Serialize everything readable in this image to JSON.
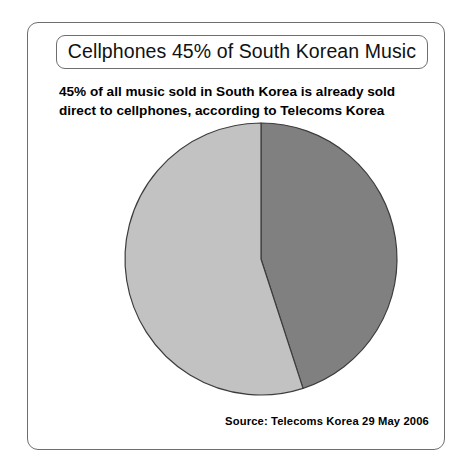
{
  "card": {
    "title": "Cellphones 45% of South Korean Music",
    "subtitle_line_1": "45% of all music sold in South Korea is already sold",
    "subtitle_line_2": "direct to cellphones, according to Telecoms Korea",
    "source": "Source: Telecoms Korea 29 May 2006"
  },
  "chart_data": {
    "type": "pie",
    "title": "Cellphones 45% of South Korean Music",
    "subtitle": "45% of all music sold in South Korea is already sold direct to cellphones, according to Telecoms Korea",
    "source": "Source: Telecoms Korea 29 May 2006",
    "categories": [
      "Sold direct to cellphones",
      "Sold through other channels"
    ],
    "values": [
      45,
      55
    ],
    "unit": "%",
    "colors": [
      "#808080",
      "#c2c2c2"
    ],
    "slice_outline_color": "#3c3c3c",
    "start_angle_deg": 0,
    "direction": "clockwise",
    "legend": "none",
    "labels_shown": false,
    "slices": [
      {
        "name": "Sold direct to cellphones",
        "value": 45,
        "color": "#808080",
        "sweep_deg": 162,
        "start_deg": 0,
        "end_deg": 162
      },
      {
        "name": "Sold through other channels",
        "value": 55,
        "color": "#c2c2c2",
        "sweep_deg": 198,
        "start_deg": 162,
        "end_deg": 360
      }
    ]
  },
  "geometry": {
    "center_x": 189,
    "center_y": 140,
    "radius": 136
  }
}
